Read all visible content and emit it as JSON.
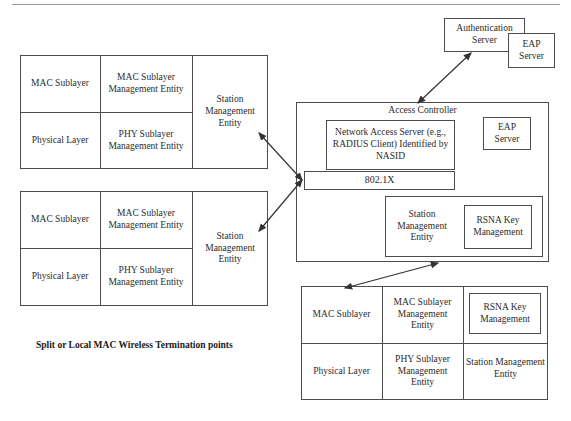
{
  "figure": {
    "caption": "Split or Local MAC Wireless Termination points",
    "title_access_controller": "Access Controller"
  },
  "station_box_1": {
    "name": "Split or Local MAC Wireless Termination point 1",
    "mac_sublayer": "MAC Sublayer",
    "mac_sublayer_mgmt": "MAC Sublayer Management Entity",
    "physical_layer": "Physical Layer",
    "phy_sublayer_mgmt": "PHY Sublayer Management Entity",
    "station_mgmt": "Station Management Entity"
  },
  "station_box_2": {
    "name": "Split or Local MAC Wireless Termination point 2",
    "mac_sublayer": "MAC Sublayer",
    "mac_sublayer_mgmt": "MAC Sublayer Management Entity",
    "physical_layer": "Physical Layer",
    "phy_sublayer_mgmt": "PHY Sublayer Management Entity",
    "station_mgmt": "Station Management Entity"
  },
  "access_controller": {
    "title": "Access Controller",
    "network_access_server": "Network Access Server (e.g., RADIUS Client) Identified by NASID",
    "eap_server": "EAP Server",
    "dot1x": "802.1X",
    "station_mgmt": "Station Management Entity",
    "rsna_key_mgmt": "RSNA Key Management"
  },
  "auth_server_group": {
    "authentication_server": "Authentication Server",
    "eap_server": "EAP Server"
  },
  "station_box_3": {
    "name": "Station with RSNA Key Management",
    "mac_sublayer": "MAC Sublayer",
    "mac_sublayer_mgmt": "MAC Sublayer Management Entity",
    "physical_layer": "Physical Layer",
    "phy_sublayer_mgmt": "PHY Sublayer Management Entity",
    "rsna_key_mgmt": "RSNA Key Management",
    "station_mgmt": "Station Management Entity"
  },
  "colors": {
    "line": "#4d4d4d",
    "text": "#2b2b2b",
    "rule": "#9a9a9a"
  },
  "connections": [
    {
      "id": "sta1-to-ac",
      "from": "station_box_1.station_mgmt",
      "to": "access_controller.dot1x",
      "style": "double-arrow"
    },
    {
      "id": "sta2-to-ac",
      "from": "station_box_2.station_mgmt",
      "to": "access_controller.dot1x",
      "style": "double-arrow"
    },
    {
      "id": "ac-to-auth",
      "from": "access_controller",
      "to": "auth_server_group.authentication_server",
      "style": "double-arrow"
    },
    {
      "id": "ac-to-sta3",
      "from": "station_box_3.mac_sublayer",
      "to": "access_controller",
      "style": "double-arrow"
    }
  ]
}
